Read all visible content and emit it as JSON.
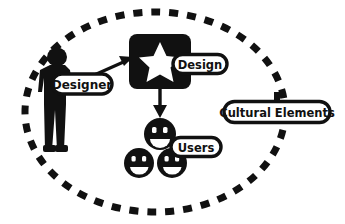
{
  "diagram": {
    "title": "Designer Design Users Cultural Elements",
    "background_color": "#ffffff",
    "ink_color": "#111111",
    "boundary": {
      "name": "cultural-context-boundary",
      "style": "dashed-ellipse",
      "cx": 155,
      "cy": 112,
      "rx": 130,
      "ry": 100
    },
    "nodes": {
      "designer": {
        "label": "Designer",
        "icon": "person-silhouette-icon",
        "pill_x": 82,
        "pill_y": 84,
        "pill_w": 60,
        "pill_h": 20
      },
      "design": {
        "label": "Design",
        "icon": "star-icon",
        "pill_x": 200,
        "pill_y": 64,
        "pill_w": 54,
        "pill_h": 19
      },
      "users": {
        "label": "Users",
        "icon": "smiley-faces-icon",
        "pill_x": 196,
        "pill_y": 147,
        "pill_w": 50,
        "pill_h": 19
      },
      "cultural_elements": {
        "label": "Cultural Elements",
        "pill_x": 277,
        "pill_y": 112,
        "pill_w": 106,
        "pill_h": 21
      }
    },
    "arrows": [
      {
        "name": "designer-to-design-arrow",
        "from": "designer",
        "to": "design",
        "direction": "up-right"
      },
      {
        "name": "design-to-users-arrow",
        "from": "design",
        "to": "users",
        "direction": "down"
      }
    ]
  }
}
